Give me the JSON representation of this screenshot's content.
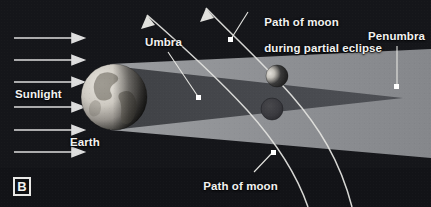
{
  "figure": {
    "panel_letter": "B",
    "background_color": "#15161a",
    "caption_text_color": "#f2f2f0"
  },
  "labels": {
    "sunlight": "Sunlight",
    "earth": "Earth",
    "umbra": "Umbra",
    "penumbra": "Penumbra",
    "path_partial_line1": "Path of moon",
    "path_partial_line2": "during partial eclipse",
    "path_total_line1": "Path of moon",
    "path_total_line2": "during total eclipse"
  },
  "diagram": {
    "type": "lunar-eclipse-shadow-diagram",
    "light_source": "Sun (off-frame left)",
    "sunlight_ray_count": 6,
    "sunlight_ray_color": "#dedede",
    "earth": {
      "center_x": 114,
      "center_y": 97,
      "radius": 33,
      "lit_side": "left",
      "terminator": "right-of-center"
    },
    "penumbra": {
      "color": "#8e9093",
      "description": "wide diverging cone of partial shadow",
      "top_edge_start_y": 64,
      "bottom_edge_start_y": 130,
      "right_top_y": 56,
      "right_bottom_y": 150
    },
    "umbra": {
      "color": "#4a4c50",
      "description": "dark converging cone of full shadow",
      "apex_x": 403,
      "apex_y": 98,
      "start_top_y": 66,
      "start_bottom_y": 130
    },
    "moons": [
      {
        "name": "moon-partial-eclipse",
        "cx": 277,
        "cy": 76,
        "r": 11,
        "state": "partially shadowed",
        "lit_fraction": "crescent on left limb"
      },
      {
        "name": "moon-total-eclipse",
        "cx": 272,
        "cy": 109,
        "r": 11,
        "state": "fully inside umbra",
        "lit_fraction": "none"
      }
    ],
    "orbit_paths": [
      {
        "name": "path-partial-eclipse",
        "description": "upper arc crossing penumbra only"
      },
      {
        "name": "path-total-eclipse",
        "description": "lower arc passing through umbra"
      }
    ],
    "leader_lines": [
      {
        "from": "umbra-label",
        "to_x": 199,
        "to_y": 98
      },
      {
        "from": "penumbra-label",
        "to_x": 397,
        "to_y": 86
      },
      {
        "from": "path-partial-label",
        "to_x": 231,
        "to_y": 39
      },
      {
        "from": "path-total-label",
        "to_x": 273,
        "to_y": 152
      }
    ]
  }
}
